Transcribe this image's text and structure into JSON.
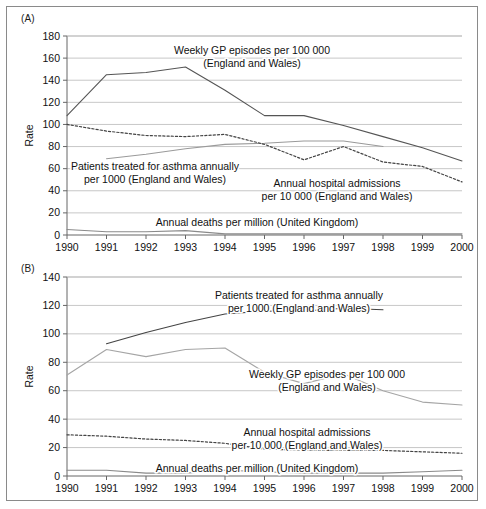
{
  "figure": {
    "panels": [
      {
        "tag": "(A)",
        "ylabel": "Rate",
        "ylim": [
          0,
          180
        ],
        "yticks": [
          0,
          20,
          40,
          60,
          80,
          100,
          120,
          140,
          160,
          180
        ],
        "xticks": [
          "1990",
          "1991",
          "1992",
          "1993",
          "1994",
          "1995",
          "1996",
          "1997",
          "1998",
          "1999",
          "2000"
        ],
        "annotations": [
          {
            "name": "gp-episodes",
            "lines": [
              "Weekly GP episodes per 100 000",
              "(England and Wales)"
            ],
            "x": 245,
            "y": 47,
            "anchor": "middle"
          },
          {
            "name": "patients-treated",
            "lines": [
              "Patients treated for asthma annually",
              "per 1000 (England and Wales)"
            ],
            "x": 148,
            "y": 163,
            "anchor": "middle"
          },
          {
            "name": "hospital-admissions",
            "lines": [
              "Annual hospital admissions",
              "per 10 000 (England and Wales)"
            ],
            "x": 330,
            "y": 180,
            "anchor": "middle"
          },
          {
            "name": "annual-deaths",
            "lines": [
              "Annual deaths per million (United Kingdom)"
            ],
            "x": 250,
            "y": 219,
            "anchor": "middle"
          }
        ]
      },
      {
        "tag": "(B)",
        "ylabel": "Rate",
        "ylim": [
          0,
          140
        ],
        "yticks": [
          0,
          20,
          40,
          60,
          80,
          100,
          120,
          140
        ],
        "xticks": [
          "1990",
          "1991",
          "1992",
          "1993",
          "1994",
          "1995",
          "1996",
          "1997",
          "1998",
          "1999",
          "2000"
        ],
        "annotations": [
          {
            "name": "patients-treated",
            "lines": [
              "Patients treated for asthma annually",
              "per 1000 (England and Wales)"
            ],
            "x": 292,
            "y": 40,
            "anchor": "middle"
          },
          {
            "name": "gp-episodes",
            "lines": [
              "Weekly GP episodes per 100 000",
              "(England and Wales)"
            ],
            "x": 320,
            "y": 119,
            "anchor": "middle"
          },
          {
            "name": "hospital-admissions",
            "lines": [
              "Annual hospital admissions",
              "per 10 000 (England and Wales)"
            ],
            "x": 300,
            "y": 177,
            "anchor": "middle"
          },
          {
            "name": "annual-deaths",
            "lines": [
              "Annual deaths per million (United Kingdom)"
            ],
            "x": 250,
            "y": 213,
            "anchor": "middle"
          }
        ]
      }
    ]
  },
  "chart_data": [
    {
      "type": "line",
      "panel": "(A)",
      "title": "",
      "xlabel": "",
      "ylabel": "Rate",
      "x": [
        1990,
        1991,
        1992,
        1993,
        1994,
        1995,
        1996,
        1997,
        1998,
        1999,
        2000
      ],
      "xlim": [
        1990,
        2000
      ],
      "ylim": [
        0,
        180
      ],
      "grid": true,
      "note": "All series indexed so that 1990 = 100 except where the series starts later",
      "series": [
        {
          "name": "Weekly GP episodes per 100 000 (England and Wales)",
          "style": "solid",
          "color": "#555555",
          "x": [
            1990,
            1991,
            1992,
            1993,
            1994,
            1995,
            1996,
            1997,
            1998,
            1999,
            2000
          ],
          "values": [
            108,
            145,
            147,
            152,
            131,
            108,
            108,
            99,
            89,
            79,
            67
          ]
        },
        {
          "name": "Patients treated for asthma annually per 1000 (England and Wales)",
          "style": "solid",
          "color": "#9a9a9a",
          "x": [
            1991,
            1992,
            1993,
            1994,
            1995,
            1996,
            1997,
            1998
          ],
          "values": [
            69,
            73,
            78,
            82,
            83,
            85,
            85,
            80
          ]
        },
        {
          "name": "Annual hospital admissions per 10 000 (England and Wales)",
          "style": "dotted",
          "color": "#444444",
          "x": [
            1990,
            1991,
            1992,
            1993,
            1994,
            1995,
            1996,
            1997,
            1998,
            1999,
            2000
          ],
          "values": [
            100,
            94,
            90,
            89,
            91,
            82,
            68,
            80,
            66,
            62,
            48
          ]
        },
        {
          "name": "Annual deaths per million (United Kingdom)",
          "style": "solid",
          "color": "#8a8a8a",
          "x": [
            1990,
            1991,
            1992,
            1993,
            1994,
            1995,
            1996,
            1997,
            1998,
            1999,
            2000
          ],
          "values": [
            5,
            3,
            3,
            4,
            1,
            1,
            1,
            1,
            1,
            1,
            1
          ]
        }
      ]
    },
    {
      "type": "line",
      "panel": "(B)",
      "title": "",
      "xlabel": "",
      "ylabel": "Rate",
      "x": [
        1990,
        1991,
        1992,
        1993,
        1994,
        1995,
        1996,
        1997,
        1998,
        1999,
        2000
      ],
      "xlim": [
        1990,
        2000
      ],
      "ylim": [
        0,
        140
      ],
      "grid": true,
      "series": [
        {
          "name": "Patients treated for asthma annually per 1000 (England and Wales)",
          "style": "solid",
          "color": "#444444",
          "x": [
            1991,
            1992,
            1993,
            1994,
            1995,
            1996,
            1997,
            1998
          ],
          "values": [
            93,
            101,
            108,
            114,
            116,
            116,
            118,
            117
          ]
        },
        {
          "name": "Weekly GP episodes per 100 000 (England and Wales)",
          "style": "solid",
          "color": "#a5a5a5",
          "x": [
            1990,
            1991,
            1992,
            1993,
            1994,
            1995,
            1996,
            1997,
            1998,
            1999,
            2000
          ],
          "values": [
            71,
            89,
            84,
            89,
            90,
            73,
            65,
            72,
            60,
            52,
            50
          ]
        },
        {
          "name": "Annual hospital admissions per 10 000 (England and Wales)",
          "style": "dotted",
          "color": "#444444",
          "x": [
            1990,
            1991,
            1992,
            1993,
            1994,
            1995,
            1996,
            1997,
            1998,
            1999,
            2000
          ],
          "values": [
            29,
            28,
            26,
            25,
            23,
            19,
            18,
            18,
            18,
            17,
            16
          ]
        },
        {
          "name": "Annual deaths per million (United Kingdom)",
          "style": "solid",
          "color": "#8a8a8a",
          "x": [
            1990,
            1991,
            1992,
            1993,
            1994,
            1995,
            1996,
            1997,
            1998,
            1999,
            2000
          ],
          "values": [
            4,
            4,
            2,
            2,
            4,
            3,
            2,
            2,
            2,
            3,
            4
          ]
        }
      ]
    }
  ]
}
